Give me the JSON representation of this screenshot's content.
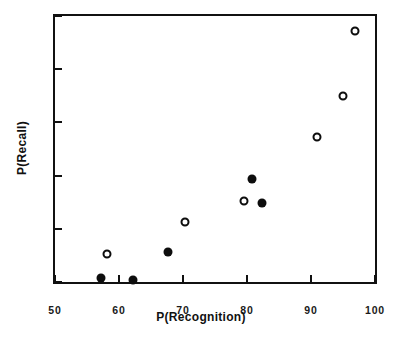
{
  "chart_data": {
    "type": "scatter",
    "title": "",
    "xlabel": "P(Recognition)",
    "ylabel": "P(Recall)",
    "xlim": [
      50,
      100
    ],
    "ylim": [
      0,
      50
    ],
    "xticks": [
      50,
      60,
      70,
      80,
      90,
      100
    ],
    "yticks": [
      0,
      10,
      20,
      30,
      40,
      50
    ],
    "xticklabels": [
      "50",
      "60",
      "70",
      "80",
      "90",
      "100"
    ],
    "yticklabels": [
      "0",
      "10",
      "20",
      "30",
      "40",
      "50"
    ],
    "grid": false,
    "legend": "none",
    "series": [
      {
        "name": "filled-circles",
        "marker": "filled-circle",
        "color": "#0d0d0d",
        "points": [
          {
            "x": 57.2,
            "y": 0.7
          },
          {
            "x": 62.2,
            "y": 0.4
          },
          {
            "x": 67.6,
            "y": 5.7
          },
          {
            "x": 80.8,
            "y": 19.4
          },
          {
            "x": 82.3,
            "y": 14.8
          }
        ]
      },
      {
        "name": "open-circles",
        "marker": "open-circle",
        "color": "#0d0d0d",
        "points": [
          {
            "x": 58.2,
            "y": 5.2
          },
          {
            "x": 70.3,
            "y": 11.2
          },
          {
            "x": 79.5,
            "y": 15.3
          },
          {
            "x": 91.0,
            "y": 27.2
          },
          {
            "x": 95.0,
            "y": 34.9
          },
          {
            "x": 96.8,
            "y": 47.2
          }
        ]
      }
    ]
  }
}
